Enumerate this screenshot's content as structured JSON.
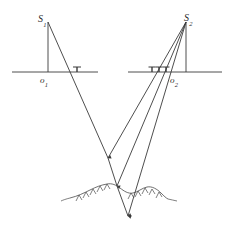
{
  "figure": {
    "width": 228,
    "height": 235,
    "background_color": "#ffffff",
    "stroke_color": "#3a3a3a",
    "terrain_color": "#4a4a4a"
  },
  "labels": {
    "station_left": {
      "base": "S",
      "sub": "1",
      "x": 38,
      "y": 14
    },
    "station_right": {
      "base": "S",
      "sub": "2",
      "x": 184,
      "y": 13
    },
    "principal_left": {
      "base": "o",
      "sub": "1",
      "x": 40,
      "y": 76
    },
    "principal_right": {
      "base": "o",
      "sub": "2",
      "x": 170,
      "y": 76
    }
  },
  "geometry": {
    "station_left_point": {
      "x": 48,
      "y": 22
    },
    "station_right_point": {
      "x": 186,
      "y": 22
    },
    "image_plane_left": {
      "x1": 12,
      "y1": 72,
      "x2": 98,
      "y2": 72
    },
    "image_plane_right": {
      "x1": 128,
      "y1": 72,
      "x2": 222,
      "y2": 72
    },
    "principal_axis_left": {
      "x1": 48,
      "y1": 22,
      "x2": 48,
      "y2": 72
    },
    "principal_axis_right": {
      "x1": 186,
      "y1": 22,
      "x2": 186,
      "y2": 72
    },
    "ground_point_upper": {
      "x": 108,
      "y": 158
    },
    "ground_point_middle": {
      "x": 117,
      "y": 186
    },
    "ground_point_lower": {
      "x": 128,
      "y": 216
    },
    "rays_from_left_station": [
      {
        "name": "ray-left-to-ground-upper",
        "x1": 48,
        "y1": 22,
        "x2": 108,
        "y2": 158
      }
    ],
    "rays_from_right_station": [
      {
        "name": "ray-right-to-ground-upper",
        "x1": 186,
        "y1": 22,
        "x2": 108,
        "y2": 158
      },
      {
        "name": "ray-right-to-ground-middle",
        "x1": 186,
        "y1": 22,
        "x2": 117,
        "y2": 186
      },
      {
        "name": "ray-right-to-ground-lower",
        "x1": 186,
        "y1": 22,
        "x2": 128,
        "y2": 216
      }
    ],
    "image_ticks_left": [
      {
        "name": "tick-left-1",
        "x": 77,
        "y": 72
      }
    ],
    "image_ticks_right": [
      {
        "name": "tick-right-1",
        "x": 152,
        "y": 72
      },
      {
        "name": "tick-right-2",
        "x": 159,
        "y": 72
      },
      {
        "name": "tick-right-3",
        "x": 166,
        "y": 72
      }
    ],
    "terrain_profile": "M 70 198 C 78 196 84 193 90 190 C 96 187 101 185 107 184 C 112 183 116 185 120 188 C 124 191 128 194 133 193 C 138 192 142 188 147 187 C 152 186 157 189 161 193 C 164 196 166 198 168 199"
  }
}
